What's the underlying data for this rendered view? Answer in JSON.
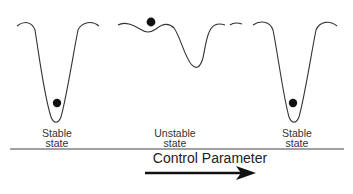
{
  "diagram": {
    "title": "",
    "states": [
      {
        "id": "stable-left",
        "line1": "Stable",
        "line2": "state"
      },
      {
        "id": "unstable-middle",
        "line1": "Unstable",
        "line2": "state"
      },
      {
        "id": "stable-right",
        "line1": "Stable",
        "line2": "state"
      }
    ],
    "axis": {
      "label": "Control Parameter",
      "direction": "left-to-right"
    },
    "colors": {
      "stroke": "#333333",
      "ball": "#111111",
      "background": "#ffffff"
    }
  }
}
